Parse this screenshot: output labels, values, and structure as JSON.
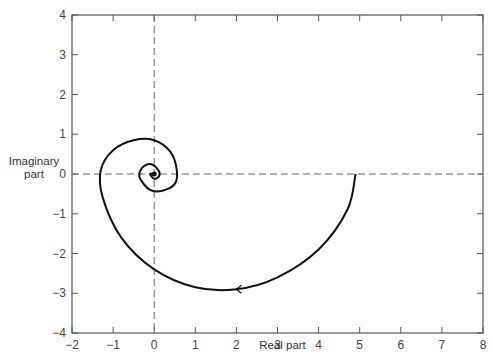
{
  "chart_data": {
    "type": "line",
    "title": "",
    "xlabel": "Real part",
    "ylabel": "Imaginary part",
    "ylabel_lines": [
      "Imaginary",
      "part"
    ],
    "xlim": [
      -2,
      8
    ],
    "ylim": [
      -4,
      4
    ],
    "xticks": [
      -2,
      -1,
      0,
      1,
      2,
      3,
      4,
      5,
      6,
      7,
      8
    ],
    "yticks": [
      -4,
      -3,
      -2,
      -1,
      0,
      1,
      2,
      3,
      4
    ],
    "xtick_labels": [
      "−2",
      "−1",
      "0",
      "1",
      "2",
      "3",
      "4",
      "5",
      "6",
      "7",
      "8"
    ],
    "ytick_labels": [
      "−4",
      "−3",
      "−2",
      "−1",
      "0",
      "1",
      "2",
      "3",
      "4"
    ],
    "grid": false,
    "reference_lines": [
      {
        "orientation": "horizontal",
        "value": 0,
        "style": "dashed"
      },
      {
        "orientation": "vertical",
        "value": 0,
        "style": "dashed"
      }
    ],
    "series": [
      {
        "name": "spiral trajectory",
        "description": "Clockwise inward spiral starting at (4.9, 0) converging to origin; arrow near (2, -2.9) pointing left",
        "x": [
          4.9,
          4.7,
          4.0,
          3.0,
          2.0,
          1.0,
          0.0,
          -0.8,
          -1.25,
          -1.3,
          -1.0,
          -0.5,
          0.0,
          0.4,
          0.55,
          0.5,
          0.2,
          -0.1,
          -0.35,
          -0.3,
          -0.1,
          0.1,
          0.12,
          0.0,
          -0.1,
          0.0
        ],
        "y": [
          0.0,
          -0.9,
          -1.9,
          -2.6,
          -2.9,
          -2.85,
          -2.4,
          -1.6,
          -0.6,
          0.1,
          0.6,
          0.85,
          0.85,
          0.55,
          0.1,
          -0.25,
          -0.42,
          -0.4,
          -0.1,
          0.15,
          0.25,
          0.1,
          -0.05,
          -0.12,
          0.0,
          0.0
        ]
      }
    ],
    "annotations": [
      {
        "type": "arrow",
        "x": 2.0,
        "y": -2.9,
        "direction": "left"
      }
    ],
    "legend": null
  }
}
